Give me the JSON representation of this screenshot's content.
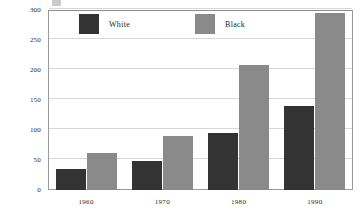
{
  "chart_data": {
    "type": "bar",
    "title": "",
    "subtitle": "",
    "xlabel": "",
    "ylabel": "",
    "categories": [
      "1960",
      "1970",
      "1980",
      "1990"
    ],
    "series": [
      {
        "name": "White",
        "color": "#333333",
        "values": [
          35,
          48,
          95,
          140
        ]
      },
      {
        "name": "Black",
        "color": "#8a8a8a",
        "values": [
          62,
          90,
          208,
          295
        ]
      }
    ],
    "ylim": [
      0,
      300
    ],
    "yticks": [
      0,
      50,
      100,
      150,
      200,
      250,
      300
    ],
    "ytick_labels": [
      "0",
      "50",
      "100",
      "150",
      "200",
      "250",
      "300"
    ],
    "grid": true,
    "grid_axis": "y",
    "legend_position": "top-left-inside",
    "annotations": []
  },
  "legend": {
    "entries": [
      {
        "label": "White",
        "swatch_color": "#333333"
      },
      {
        "label": "Black",
        "swatch_color": "#8a8a8a"
      }
    ]
  },
  "axes": {
    "y_tick_labels": [
      "300",
      "250",
      "200",
      "150",
      "100",
      "50",
      "0"
    ],
    "x_tick_labels": [
      "1960",
      "1970",
      "1980",
      "1990"
    ]
  },
  "colors": {
    "white_series": "#333333",
    "black_series": "#8a8a8a",
    "gridline": "#d8d8d8",
    "frame": "#9a9a9a",
    "background": "#ffffff"
  }
}
